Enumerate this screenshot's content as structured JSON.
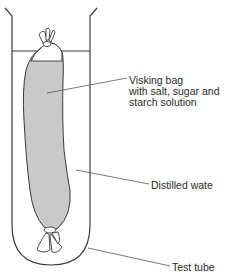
{
  "diagram": {
    "labels": {
      "visking_line1": "Visking bag",
      "visking_line2": "with salt, sugar and",
      "visking_line3": "starch solution",
      "distilled_water": "Distilled wate",
      "test_tube": "Test tube"
    },
    "colors": {
      "bag_fill": "#c9c9c9",
      "line": "#3a3a3a",
      "background": "#ffffff"
    }
  }
}
